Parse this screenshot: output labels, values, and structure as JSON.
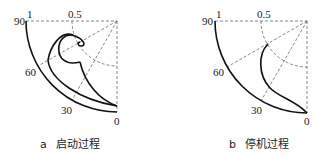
{
  "panels": [
    {
      "id": "a",
      "caption_letter": "a",
      "caption": "启动过程",
      "labels": {
        "r1": "1",
        "r05": "0.5",
        "a90": "90",
        "a60": "60",
        "a30": "30",
        "a0": "0"
      }
    },
    {
      "id": "b",
      "caption_letter": "b",
      "caption": "停机过程",
      "labels": {
        "r1": "1",
        "r05": "0.5",
        "a90": "90",
        "a60": "60",
        "a30": "30",
        "a0": "0"
      }
    }
  ]
}
